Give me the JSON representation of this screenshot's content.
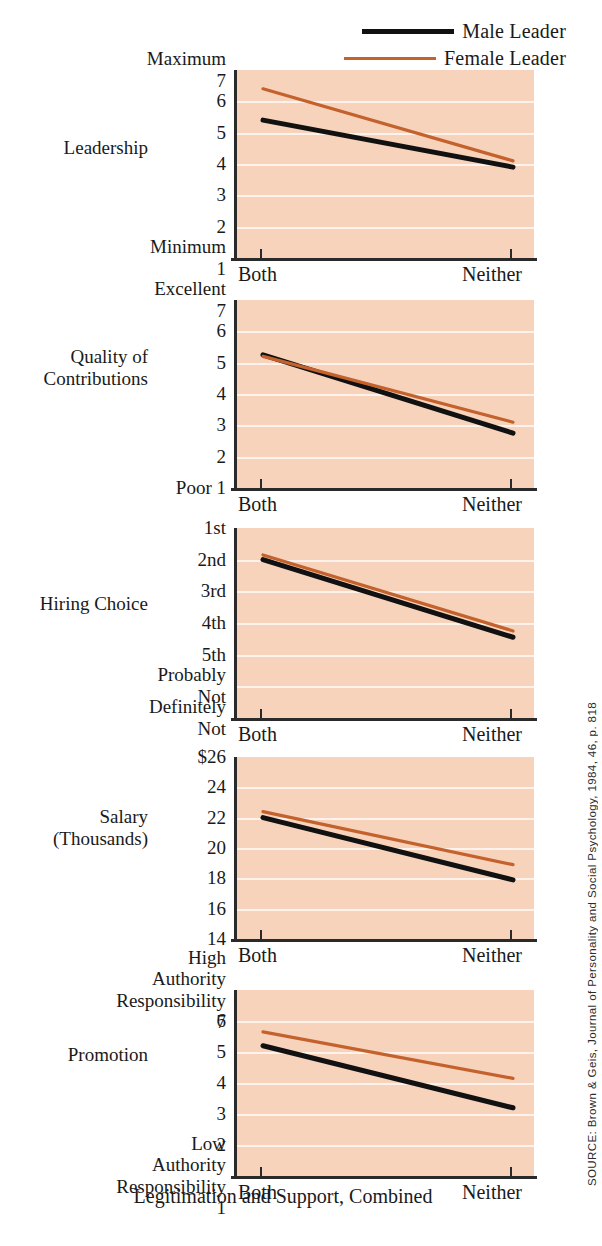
{
  "legend": {
    "items": [
      {
        "label": "Male Leader",
        "color": "#111111",
        "style": "thick-black-line"
      },
      {
        "label": "Female Leader",
        "color": "#c4622d",
        "style": "thin-orange-line"
      }
    ]
  },
  "xaxis": {
    "title": "Legitimation and Support, Combined",
    "categories": [
      "Both",
      "Neither"
    ]
  },
  "source": "SOURCE: Brown & Geis, Journal of Personality and Social Psychology, 1984, 46, p. 818",
  "colors": {
    "plot_background": "#f8d3bc",
    "gridline": "#fdf3ec",
    "male_line": "#111111",
    "female_line": "#c4622d",
    "axis": "#2a2a2a"
  },
  "panels": [
    {
      "row_label": "Leadership",
      "ticks": [
        "Maximum 7",
        "6",
        "5",
        "4",
        "3",
        "2",
        "Minimum 1"
      ],
      "tick_values": [
        7,
        6,
        5,
        4,
        3,
        2,
        1
      ]
    },
    {
      "row_label": "Quality of\nContributions",
      "ticks": [
        "Excellent 7",
        "6",
        "5",
        "4",
        "3",
        "2",
        "Poor 1"
      ],
      "tick_values": [
        7,
        6,
        5,
        4,
        3,
        2,
        1
      ]
    },
    {
      "row_label": "Hiring Choice",
      "ticks": [
        "1st",
        "2nd",
        "3rd",
        "4th",
        "5th",
        "Probably Not",
        "Definitely Not"
      ],
      "tick_values": [
        1,
        2,
        3,
        4,
        5,
        6,
        7
      ]
    },
    {
      "row_label": "Salary\n(Thousands)",
      "ticks": [
        "$26",
        "24",
        "22",
        "20",
        "18",
        "16",
        "14"
      ],
      "tick_values": [
        26,
        24,
        22,
        20,
        18,
        16,
        14
      ]
    },
    {
      "row_label": "Promotion",
      "ticks": [
        "High Authority\nResponsibility 7",
        "6",
        "5",
        "4",
        "3",
        "2",
        "Low Authority\nResponsibility 1"
      ],
      "tick_values": [
        7,
        6,
        5,
        4,
        3,
        2,
        1
      ]
    }
  ],
  "chart_data": [
    {
      "type": "line",
      "title": "Leadership",
      "xlabel": "Legitimation and Support, Combined",
      "ylabel": "Leadership",
      "x": [
        "Both",
        "Neither"
      ],
      "ylim": [
        1,
        7
      ],
      "ytick_labels": [
        "Maximum 7",
        "6",
        "5",
        "4",
        "3",
        "2",
        "Minimum 1"
      ],
      "grid": true,
      "legend_position": "top-right",
      "series": [
        {
          "name": "Male Leader",
          "values": [
            5.4,
            3.9
          ],
          "color": "#111111"
        },
        {
          "name": "Female Leader",
          "values": [
            6.4,
            4.1
          ],
          "color": "#c4622d"
        }
      ]
    },
    {
      "type": "line",
      "title": "Quality of Contributions",
      "xlabel": "Legitimation and Support, Combined",
      "ylabel": "Quality of Contributions",
      "x": [
        "Both",
        "Neither"
      ],
      "ylim": [
        1,
        7
      ],
      "ytick_labels": [
        "Excellent 7",
        "6",
        "5",
        "4",
        "3",
        "2",
        "Poor 1"
      ],
      "grid": true,
      "series": [
        {
          "name": "Male Leader",
          "values": [
            5.25,
            2.75
          ],
          "color": "#111111"
        },
        {
          "name": "Female Leader",
          "values": [
            5.2,
            3.1
          ],
          "color": "#c4622d"
        }
      ]
    },
    {
      "type": "line",
      "title": "Hiring Choice",
      "xlabel": "Legitimation and Support, Combined",
      "ylabel": "Hiring Choice",
      "x": [
        "Both",
        "Neither"
      ],
      "ylim": [
        1,
        7
      ],
      "ytick_labels": [
        "1st",
        "2nd",
        "3rd",
        "4th",
        "5th",
        "Probably Not",
        "Definitely Not"
      ],
      "axis_inverted": true,
      "grid": true,
      "series": [
        {
          "name": "Male Leader",
          "values": [
            2.0,
            4.45
          ],
          "color": "#111111"
        },
        {
          "name": "Female Leader",
          "values": [
            1.85,
            4.25
          ],
          "color": "#c4622d"
        }
      ]
    },
    {
      "type": "line",
      "title": "Salary (Thousands)",
      "xlabel": "Legitimation and Support, Combined",
      "ylabel": "Salary (Thousands)",
      "x": [
        "Both",
        "Neither"
      ],
      "ylim": [
        14,
        26
      ],
      "ytick_labels": [
        "$26",
        "24",
        "22",
        "20",
        "18",
        "16",
        "14"
      ],
      "grid": true,
      "series": [
        {
          "name": "Male Leader",
          "values": [
            22.0,
            17.9
          ],
          "color": "#111111"
        },
        {
          "name": "Female Leader",
          "values": [
            22.4,
            18.9
          ],
          "color": "#c4622d"
        }
      ]
    },
    {
      "type": "line",
      "title": "Promotion",
      "xlabel": "Legitimation and Support, Combined",
      "ylabel": "Promotion",
      "x": [
        "Both",
        "Neither"
      ],
      "ylim": [
        1,
        7
      ],
      "ytick_labels": [
        "High Authority Responsibility 7",
        "6",
        "5",
        "4",
        "3",
        "2",
        "Low Authority Responsibility 1"
      ],
      "grid": true,
      "series": [
        {
          "name": "Male Leader",
          "values": [
            5.2,
            3.2
          ],
          "color": "#111111"
        },
        {
          "name": "Female Leader",
          "values": [
            5.65,
            4.15
          ],
          "color": "#c4622d"
        }
      ]
    }
  ]
}
